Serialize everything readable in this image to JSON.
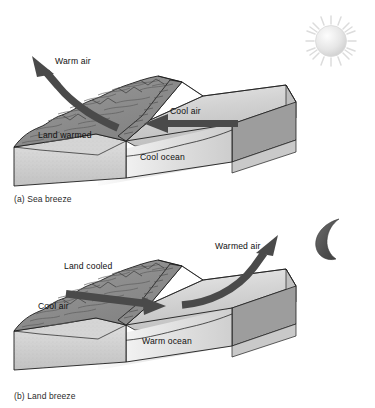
{
  "figure": {
    "background_color": "#ffffff",
    "ink_color": "#1a1a1a"
  },
  "panels": [
    {
      "id": "sea-breeze",
      "caption": "(a) Sea breeze",
      "celestial_icon": "sun-icon",
      "celestial_label": "sun",
      "labels": {
        "air_rising": "Warm air",
        "land": "Land warmed",
        "air_horizontal": "Cool air",
        "ocean": "Cool ocean"
      },
      "arrows": [
        {
          "name": "warm-air-arrow",
          "label": "Warm air",
          "direction": "up-left",
          "style": "curved"
        },
        {
          "name": "cool-air-arrow",
          "label": "Cool air",
          "direction": "left",
          "style": "straight"
        }
      ]
    },
    {
      "id": "land-breeze",
      "caption": "(b) Land breeze",
      "celestial_icon": "moon-icon",
      "celestial_label": "crescent moon",
      "labels": {
        "land": "Land cooled",
        "air_horizontal": "Cool air",
        "air_rising": "Warmed air",
        "ocean": "Warm ocean"
      },
      "arrows": [
        {
          "name": "cool-air-arrow",
          "label": "Cool air",
          "direction": "right",
          "style": "straight"
        },
        {
          "name": "warmed-air-arrow",
          "label": "Warmed air",
          "direction": "up-right",
          "style": "curved"
        }
      ]
    }
  ],
  "colors": {
    "arrow_fill": "#4a4a4a",
    "land_top": "#8e8e8e",
    "land_front": "#cfcfcf",
    "ocean_surface": "#d7d7d7",
    "ocean_side": "#9a9a9a",
    "outline": "#1c1c1c",
    "sun": "#e2e2e2",
    "moon": "#5a5a5a"
  }
}
